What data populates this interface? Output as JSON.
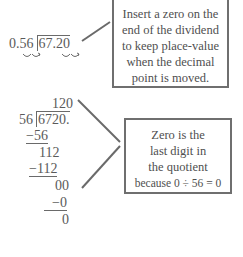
{
  "top_problem": {
    "divisor": "0.56",
    "dividend": "67.20",
    "arrow_marks": [
      "divisor-decimal-shift-arrows",
      "dividend-decimal-shift-arrows"
    ]
  },
  "top_callout": {
    "lines": [
      "Insert a zero on the",
      "end of the dividend",
      "to keep place-value",
      "when the decimal",
      "point is moved."
    ]
  },
  "long_division": {
    "quotient": "120",
    "divisor": "56",
    "dividend": "6720.",
    "steps": [
      {
        "text": "−56",
        "underlined": true
      },
      {
        "text": "112",
        "underlined": false
      },
      {
        "text": "−112",
        "underlined": true
      },
      {
        "text": "00",
        "underlined": false
      },
      {
        "text": "−0",
        "underlined": true
      },
      {
        "text": "0",
        "underlined": false
      }
    ]
  },
  "bottom_callout": {
    "lines": [
      "Zero is the",
      "last digit in",
      "the quotient",
      "because 0 ÷ 56 = 0"
    ]
  },
  "colors": {
    "text": "#5a5a5a",
    "box_border": "#6f6f6f",
    "connector": "#6a6a6a",
    "background": "#ffffff"
  }
}
